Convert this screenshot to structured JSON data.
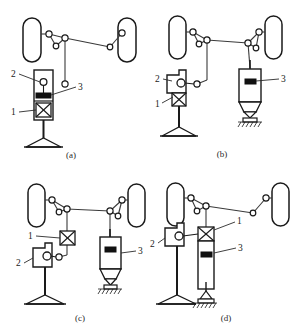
{
  "figure": {
    "type": "engineering-schematic",
    "line_color": "#1a1a1a",
    "fill_color": "#ffffff",
    "accent_dark": "#111111",
    "panels": [
      {
        "id": "a",
        "caption": "(a)",
        "callouts": [
          {
            "key": "2",
            "label": "2",
            "meaning": "steering-wheel-hub"
          },
          {
            "key": "3",
            "label": "3",
            "meaning": "assist-actuator"
          },
          {
            "key": "1",
            "label": "1",
            "meaning": "torque-sensor"
          }
        ]
      },
      {
        "id": "b",
        "caption": "(b)",
        "callouts": [
          {
            "key": "2",
            "label": "2",
            "meaning": "steering-wheel-hub"
          },
          {
            "key": "1",
            "label": "1",
            "meaning": "torque-sensor"
          },
          {
            "key": "3",
            "label": "3",
            "meaning": "assist-actuator"
          }
        ]
      },
      {
        "id": "c",
        "caption": "(c)",
        "callouts": [
          {
            "key": "1",
            "label": "1",
            "meaning": "torque-sensor"
          },
          {
            "key": "2",
            "label": "2",
            "meaning": "steering-wheel-hub"
          },
          {
            "key": "3",
            "label": "3",
            "meaning": "assist-actuator"
          }
        ]
      },
      {
        "id": "d",
        "caption": "(d)",
        "callouts": [
          {
            "key": "1",
            "label": "1",
            "meaning": "torque-sensor"
          },
          {
            "key": "2",
            "label": "2",
            "meaning": "steering-wheel-hub"
          },
          {
            "key": "3",
            "label": "3",
            "meaning": "assist-actuator"
          }
        ]
      }
    ],
    "legend_keys": {
      "1": "1",
      "2": "2",
      "3": "3"
    }
  }
}
